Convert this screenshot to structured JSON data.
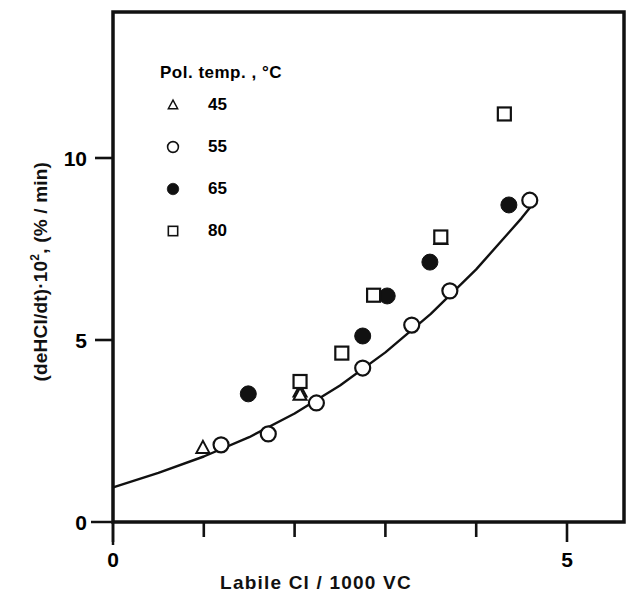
{
  "chart_data": {
    "type": "scatter",
    "title": "",
    "xlabel": "Labile Cl / 1000 VC",
    "ylabel_main": "(deHCl/dt)",
    "ylabel_exp": "2",
    "ylabel_mult": "·10",
    "ylabel_unit": ", (% / min)",
    "ylabel_full": "(deHCl/dt)·10² , (% / min)",
    "xlim": [
      0,
      5
    ],
    "ylim": [
      0,
      12.6
    ],
    "x_ticks": [
      0,
      1,
      2,
      3,
      4,
      5
    ],
    "x_tick_labels": [
      "0",
      "",
      "",
      "",
      "",
      "5"
    ],
    "y_ticks": [
      0,
      5,
      10
    ],
    "y_tick_labels": [
      "0",
      "5",
      "10"
    ],
    "y_minor_ticks": [],
    "grid": false,
    "frame": "box",
    "legend": {
      "title": "Pol. temp. ,   °C",
      "title_text": "Pol. temp.",
      "title_comma": ",",
      "title_unit": "°C",
      "position": "upper-left-inside",
      "entries": [
        {
          "marker": "open-triangle",
          "label": "45"
        },
        {
          "marker": "open-circle",
          "label": "55"
        },
        {
          "marker": "filled-circle",
          "label": "65"
        },
        {
          "marker": "open-square",
          "label": "80"
        }
      ]
    },
    "series": [
      {
        "name": "45",
        "marker": "open-triangle",
        "points": [
          {
            "x": 0.99,
            "y": 2.04
          },
          {
            "x": 2.06,
            "y": 3.59
          },
          {
            "x": 2.06,
            "y": 3.5
          },
          {
            "x": 3.61,
            "y": 7.78
          }
        ]
      },
      {
        "name": "55",
        "marker": "open-circle",
        "points": [
          {
            "x": 1.19,
            "y": 2.12
          },
          {
            "x": 1.71,
            "y": 2.42
          },
          {
            "x": 2.24,
            "y": 3.27
          },
          {
            "x": 2.75,
            "y": 4.23
          },
          {
            "x": 3.29,
            "y": 5.41
          },
          {
            "x": 3.71,
            "y": 6.35
          },
          {
            "x": 4.59,
            "y": 8.84
          }
        ]
      },
      {
        "name": "65",
        "marker": "filled-circle",
        "points": [
          {
            "x": 1.49,
            "y": 3.52
          },
          {
            "x": 2.75,
            "y": 5.11
          },
          {
            "x": 3.02,
            "y": 6.21
          },
          {
            "x": 3.49,
            "y": 7.14
          },
          {
            "x": 4.36,
            "y": 8.71
          }
        ]
      },
      {
        "name": "80",
        "marker": "open-square",
        "points": [
          {
            "x": 2.06,
            "y": 3.86
          },
          {
            "x": 2.52,
            "y": 4.64
          },
          {
            "x": 2.87,
            "y": 6.23
          },
          {
            "x": 3.61,
            "y": 7.83
          },
          {
            "x": 4.31,
            "y": 11.21
          }
        ]
      }
    ],
    "fit_curve": {
      "name": "trend-line",
      "style": "solid",
      "points": [
        {
          "x": 0.01,
          "y": 0.96
        },
        {
          "x": 0.5,
          "y": 1.35
        },
        {
          "x": 1.0,
          "y": 1.8
        },
        {
          "x": 1.5,
          "y": 2.33
        },
        {
          "x": 2.0,
          "y": 2.98
        },
        {
          "x": 2.5,
          "y": 3.75
        },
        {
          "x": 3.0,
          "y": 4.66
        },
        {
          "x": 3.5,
          "y": 5.72
        },
        {
          "x": 4.0,
          "y": 6.94
        },
        {
          "x": 4.5,
          "y": 8.35
        },
        {
          "x": 4.62,
          "y": 8.72
        }
      ]
    }
  }
}
